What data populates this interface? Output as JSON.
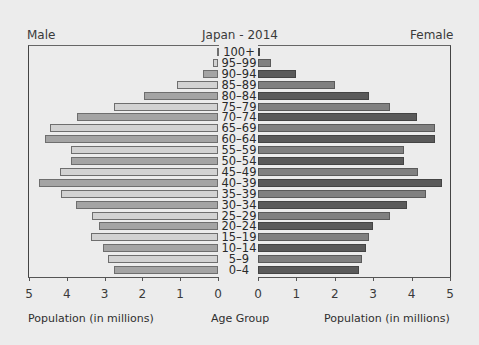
{
  "chart_data": {
    "type": "bar",
    "subtype": "population-pyramid",
    "title": "Japan - 2014",
    "left_label": "Male",
    "right_label": "Female",
    "xlabel_left": "Population (in millions)",
    "xlabel_center": "Age Group",
    "xlabel_right": "Population (in millions)",
    "xlim": [
      0,
      5
    ],
    "xticks_left": [
      "5",
      "4",
      "3",
      "2",
      "1",
      "0"
    ],
    "xticks_right": [
      "0",
      "1",
      "2",
      "3",
      "4",
      "5"
    ],
    "grid": false,
    "legend": "none",
    "categories": [
      "100+",
      "95–99",
      "90–94",
      "85–89",
      "80–84",
      "75–79",
      "70–74",
      "65–69",
      "60–64",
      "55–59",
      "50–54",
      "45–49",
      "40–39",
      "35–39",
      "30–34",
      "25–29",
      "20–24",
      "15–19",
      "10–14",
      "5–9",
      "0–4"
    ],
    "series": [
      {
        "name": "Male",
        "values": [
          0.03,
          0.12,
          0.4,
          1.08,
          1.95,
          2.75,
          3.72,
          4.44,
          4.57,
          3.88,
          3.88,
          4.18,
          4.73,
          4.15,
          3.75,
          3.33,
          3.14,
          3.35,
          3.04,
          2.9,
          2.75
        ]
      },
      {
        "name": "Female",
        "values": [
          0.05,
          0.33,
          1.0,
          2.0,
          2.88,
          3.45,
          4.13,
          4.6,
          4.6,
          3.8,
          3.8,
          4.17,
          4.78,
          4.37,
          3.88,
          3.43,
          2.99,
          2.9,
          2.8,
          2.72,
          2.62
        ]
      }
    ]
  }
}
